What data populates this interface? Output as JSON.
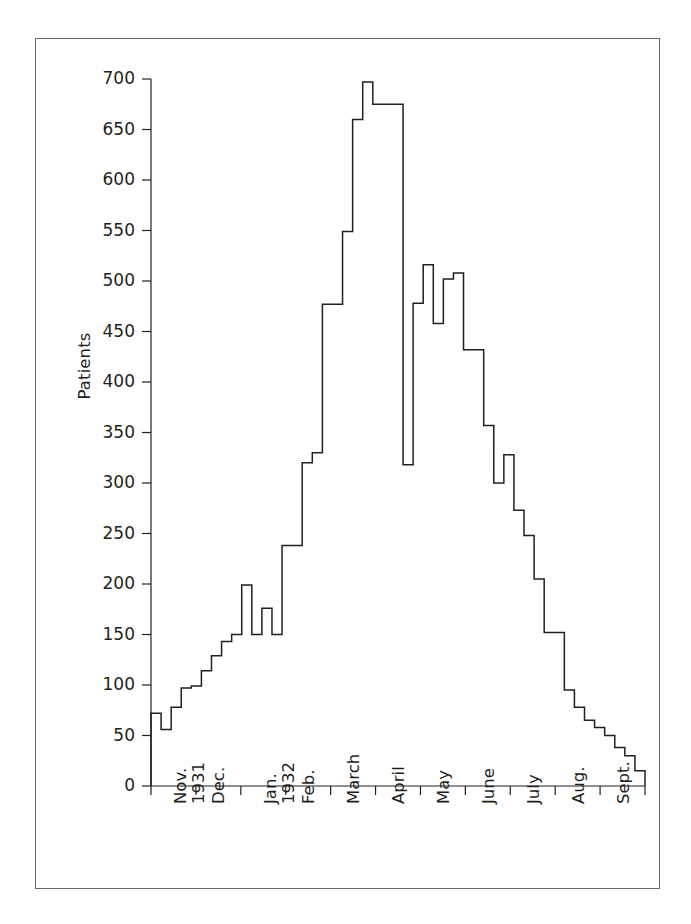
{
  "figure": {
    "background": "#ffffff",
    "line_color": "#231f20",
    "axis_color": "#231f20",
    "frame_color": "#6a6a6a"
  },
  "chart_data": {
    "type": "area",
    "title": "",
    "subtitle": "",
    "xlabel": "",
    "ylabel": "Patients",
    "ylim": [
      0,
      700
    ],
    "xlim": [
      0,
      48
    ],
    "grid": false,
    "legend": false,
    "legend_position": "none",
    "y_ticks": [
      0,
      50,
      100,
      150,
      200,
      250,
      300,
      350,
      400,
      450,
      500,
      550,
      600,
      650,
      700
    ],
    "y_tick_labels": [
      "0",
      "50",
      "100",
      "150",
      "200",
      "250",
      "300",
      "350",
      "400",
      "450",
      "500",
      "550",
      "600",
      "650",
      "700"
    ],
    "x_tick_labels": [
      {
        "line1": "Nov.",
        "line2": "1931",
        "index": 0
      },
      {
        "line1": "Dec.",
        "line2": "",
        "index": 1
      },
      {
        "line1": "Jan.",
        "line2": "1932",
        "index": 2
      },
      {
        "line1": "Feb.",
        "line2": "",
        "index": 3
      },
      {
        "line1": "March",
        "line2": "",
        "index": 4
      },
      {
        "line1": "April",
        "line2": "",
        "index": 5
      },
      {
        "line1": "May",
        "line2": "",
        "index": 6
      },
      {
        "line1": "June",
        "line2": "",
        "index": 7
      },
      {
        "line1": "July",
        "line2": "",
        "index": 8
      },
      {
        "line1": "Aug.",
        "line2": "",
        "index": 9
      },
      {
        "line1": "Sept.",
        "line2": "",
        "index": 10
      }
    ],
    "x_unit": "week",
    "series": [
      {
        "name": "Patients",
        "step_style": "post",
        "values": [
          72,
          56,
          78,
          97,
          99,
          114,
          129,
          143,
          150,
          199,
          150,
          176,
          150,
          238,
          238,
          320,
          330,
          477,
          477,
          549,
          660,
          697,
          675,
          675,
          675,
          318,
          478,
          516,
          458,
          502,
          508,
          432,
          432,
          357,
          300,
          328,
          273,
          248,
          205,
          152,
          152,
          95,
          78,
          65,
          58,
          50,
          38,
          30,
          15
        ]
      }
    ]
  }
}
